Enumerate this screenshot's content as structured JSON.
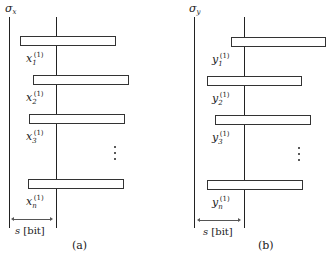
{
  "panels": [
    {
      "id": "a",
      "caption": "(a)",
      "axis_label": {
        "symbol": "σ",
        "subscript": "x"
      },
      "unit_label": {
        "var": "s",
        "unit": "[bit]"
      },
      "bars": [
        {
          "label_var": "x",
          "label_sub": "1",
          "label_sup": "(1)",
          "left": 20,
          "top": 36,
          "width": 96
        },
        {
          "label_var": "x",
          "label_sub": "2",
          "label_sup": "(1)",
          "left": 33,
          "top": 75,
          "width": 96
        },
        {
          "label_var": "x",
          "label_sub": "3",
          "label_sup": "(1)",
          "left": 29,
          "top": 114,
          "width": 96
        },
        {
          "label_var": "x",
          "label_sub": "n",
          "label_sup": "(1)",
          "left": 28,
          "top": 179,
          "width": 96
        }
      ]
    },
    {
      "id": "b",
      "caption": "(b)",
      "axis_label": {
        "symbol": "σ",
        "subscript": "y"
      },
      "unit_label": {
        "var": "s",
        "unit": "[bit]"
      },
      "bars": [
        {
          "label_var": "y",
          "label_sub": "1",
          "label_sup": "(1)",
          "left": 231,
          "top": 37,
          "width": 95
        },
        {
          "label_var": "y",
          "label_sub": "2",
          "label_sup": "(1)",
          "left": 207,
          "top": 76,
          "width": 95
        },
        {
          "label_var": "y",
          "label_sub": "3",
          "label_sup": "(1)",
          "left": 215,
          "top": 115,
          "width": 96
        },
        {
          "label_var": "y",
          "label_sub": "n",
          "label_sup": "(1)",
          "left": 207,
          "top": 180,
          "width": 96
        }
      ]
    }
  ],
  "ellipsis": "⋮"
}
